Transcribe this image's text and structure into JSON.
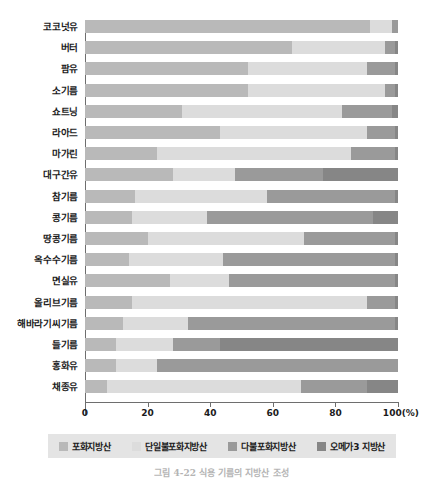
{
  "chart_data": {
    "type": "bar",
    "orientation": "horizontal",
    "stacked": true,
    "normalized_percent": true,
    "title": "",
    "xlabel": "(%)",
    "ylabel": "",
    "xlim": [
      0,
      100
    ],
    "xticks": [
      0,
      20,
      40,
      60,
      80,
      100
    ],
    "xticklabels": [
      "0",
      "20",
      "40",
      "60",
      "80",
      "100(%)"
    ],
    "grid": false,
    "legend_position": "bottom",
    "categories": [
      "코코넛유",
      "버터",
      "팜유",
      "소기름",
      "쇼트닝",
      "라아드",
      "마가린",
      "대구간유",
      "참기름",
      "콩기름",
      "땅콩기름",
      "옥수수기름",
      "면실유",
      "올리브기름",
      "해바라기씨기름",
      "들기름",
      "홍화유",
      "채종유"
    ],
    "series": [
      {
        "name": "포화지방산",
        "color": "#b9b9b9",
        "values": [
          91,
          66,
          52,
          52,
          31,
          43,
          23,
          28,
          16,
          15,
          20,
          14,
          27,
          15,
          12,
          10,
          10,
          7
        ]
      },
      {
        "name": "단일불포화지방산",
        "color": "#dcdcdc",
        "values": [
          7,
          30,
          38,
          44,
          51,
          47,
          62,
          20,
          42,
          24,
          50,
          30,
          19,
          75,
          21,
          18,
          13,
          62
        ]
      },
      {
        "name": "다불포화지방산",
        "color": "#9a9a9a",
        "values": [
          2,
          3,
          9,
          3,
          16,
          9,
          14,
          28,
          41,
          53,
          29,
          55,
          53,
          9,
          66,
          15,
          77,
          21
        ]
      },
      {
        "name": "오메가3 지방산",
        "color": "#868686",
        "values": [
          0,
          1,
          1,
          1,
          2,
          1,
          1,
          24,
          1,
          8,
          1,
          1,
          1,
          1,
          1,
          57,
          0,
          10
        ]
      }
    ]
  },
  "axis": {
    "unit_suffix": "(%)"
  },
  "legend": {
    "items": [
      {
        "label": "포화지방산",
        "swatch": "sat"
      },
      {
        "label": "단일불포화지방산",
        "swatch": "mono"
      },
      {
        "label": "다불포화지방산",
        "swatch": "poly"
      },
      {
        "label": "오메가3 지방산",
        "swatch": "omega"
      }
    ]
  },
  "caption": {
    "text": "그림 4-22   식용 기름의 지방산 조성"
  }
}
